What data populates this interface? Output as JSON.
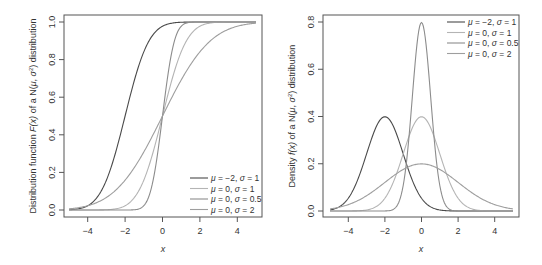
{
  "chart_data": [
    {
      "type": "line",
      "title": "",
      "xlabel": "x",
      "ylabel": "Distribution function F(x) of a N(μ, σ²) distribution",
      "xlim": [
        -5,
        5
      ],
      "ylim": [
        0,
        1
      ],
      "x_ticks": [
        "-4",
        "-2",
        "0",
        "2",
        "4"
      ],
      "y_ticks": [
        "0.0",
        "0.2",
        "0.4",
        "0.6",
        "0.8",
        "1.0"
      ],
      "grid": false,
      "legend_position": "bottom-right",
      "function": "cdf",
      "series": [
        {
          "name": "μ = −2, σ = 1",
          "mu": -2,
          "sigma": 1,
          "color": "#4a4a4a"
        },
        {
          "name": "μ = 0, σ = 1",
          "mu": 0,
          "sigma": 1,
          "color": "#b4b4b4"
        },
        {
          "name": "μ = 0, σ = 0.5",
          "mu": 0,
          "sigma": 0.5,
          "color": "#8c8c8c"
        },
        {
          "name": "μ = 0, σ = 2",
          "mu": 0,
          "sigma": 2,
          "color": "#9e9e9e"
        }
      ]
    },
    {
      "type": "line",
      "title": "",
      "xlabel": "x",
      "ylabel": "Density f(x) of a N(μ, σ²) distribution",
      "xlim": [
        -5,
        5
      ],
      "ylim": [
        0,
        0.8
      ],
      "x_ticks": [
        "-4",
        "-2",
        "0",
        "2",
        "4"
      ],
      "y_ticks": [
        "0.0",
        "0.2",
        "0.4",
        "0.6",
        "0.8"
      ],
      "grid": false,
      "legend_position": "top-right",
      "function": "pdf",
      "series": [
        {
          "name": "μ = −2, σ = 1",
          "mu": -2,
          "sigma": 1,
          "color": "#4a4a4a",
          "peak": 0.399
        },
        {
          "name": "μ = 0, σ = 1",
          "mu": 0,
          "sigma": 1,
          "color": "#b4b4b4",
          "peak": 0.399
        },
        {
          "name": "μ = 0, σ = 0.5",
          "mu": 0,
          "sigma": 0.5,
          "color": "#8c8c8c",
          "peak": 0.798
        },
        {
          "name": "μ = 0, σ = 2",
          "mu": 0,
          "sigma": 2,
          "color": "#9e9e9e",
          "peak": 0.199
        }
      ]
    }
  ],
  "plots": {
    "left": {
      "ylabel_prefix": "Distribution function ",
      "ylabel_fx": "F(x)",
      "ylabel_mid": " of a N(",
      "ylabel_mu": "μ",
      "ylabel_sep": ", ",
      "ylabel_sigma": "σ",
      "ylabel_sup": "2",
      "ylabel_suffix": ") distribution",
      "xlabel": "x"
    },
    "right": {
      "ylabel_prefix": "Density ",
      "ylabel_fx": "f(x)",
      "ylabel_mid": " of a N(",
      "ylabel_mu": "μ",
      "ylabel_sep": ", ",
      "ylabel_sigma": "σ",
      "ylabel_sup": "2",
      "ylabel_suffix": ") distribution",
      "xlabel": "x"
    }
  }
}
